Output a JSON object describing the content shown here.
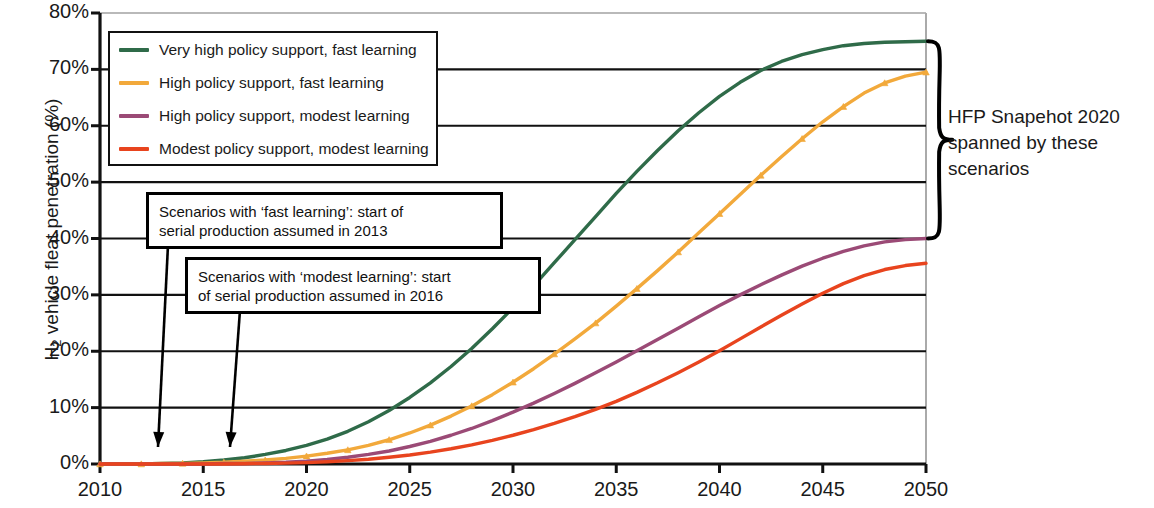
{
  "chart_data": {
    "type": "line",
    "title": "",
    "xlabel": "",
    "ylabel": "H₂ vehicle fleat penetration (%)",
    "xlim": [
      2010,
      2050
    ],
    "ylim": [
      0,
      80
    ],
    "grid": "horizontal",
    "legend_position": "top-left inside",
    "y_tick_labels": [
      "0%",
      "10%",
      "20%",
      "30%",
      "40%",
      "50%",
      "60%",
      "70%",
      "80%"
    ],
    "y_tick_values": [
      0,
      10,
      20,
      30,
      40,
      50,
      60,
      70,
      80
    ],
    "x_tick_labels": [
      "2010",
      "2015",
      "2020",
      "2025",
      "2030",
      "2035",
      "2040",
      "2045",
      "2050"
    ],
    "x_tick_values": [
      2010,
      2015,
      2020,
      2025,
      2030,
      2035,
      2040,
      2045,
      2050
    ],
    "x": [
      2010,
      2011,
      2012,
      2013,
      2014,
      2015,
      2016,
      2017,
      2018,
      2019,
      2020,
      2021,
      2022,
      2023,
      2024,
      2025,
      2026,
      2027,
      2028,
      2029,
      2030,
      2031,
      2032,
      2033,
      2034,
      2035,
      2036,
      2037,
      2038,
      2039,
      2040,
      2041,
      2042,
      2043,
      2044,
      2045,
      2046,
      2047,
      2048,
      2049,
      2050
    ],
    "series": [
      {
        "name": "Very high policy support, fast learning",
        "color": "#2f6b49",
        "marker": "none",
        "values": [
          0.0,
          0.0,
          0.0,
          0.1,
          0.2,
          0.4,
          0.7,
          1.1,
          1.7,
          2.4,
          3.3,
          4.4,
          5.8,
          7.5,
          9.5,
          11.8,
          14.4,
          17.3,
          20.5,
          24.0,
          27.7,
          31.6,
          35.7,
          39.8,
          43.9,
          48.0,
          51.9,
          55.6,
          59.1,
          62.3,
          65.2,
          67.7,
          69.8,
          71.4,
          72.6,
          73.5,
          74.2,
          74.6,
          74.8,
          74.9,
          75.0
        ]
      },
      {
        "name": "High policy support, fast learning",
        "color": "#f2a93b",
        "marker": "triangle",
        "values": [
          0.0,
          0.0,
          0.0,
          0.1,
          0.1,
          0.2,
          0.3,
          0.5,
          0.7,
          1.0,
          1.4,
          1.9,
          2.5,
          3.3,
          4.3,
          5.5,
          6.9,
          8.5,
          10.3,
          12.3,
          14.5,
          16.9,
          19.5,
          22.2,
          25.0,
          28.0,
          31.1,
          34.3,
          37.6,
          41.0,
          44.4,
          47.8,
          51.2,
          54.5,
          57.7,
          60.7,
          63.4,
          65.8,
          67.6,
          68.8,
          69.5
        ]
      },
      {
        "name": "High policy support, modest learning",
        "color": "#9b4a76",
        "marker": "none",
        "values": [
          0.0,
          0.0,
          0.0,
          0.0,
          0.0,
          0.0,
          0.1,
          0.1,
          0.2,
          0.3,
          0.5,
          0.8,
          1.2,
          1.7,
          2.3,
          3.1,
          4.0,
          5.1,
          6.3,
          7.7,
          9.2,
          10.8,
          12.5,
          14.3,
          16.2,
          18.1,
          20.1,
          22.1,
          24.1,
          26.1,
          28.1,
          30.0,
          31.8,
          33.5,
          35.1,
          36.5,
          37.7,
          38.7,
          39.4,
          39.8,
          40.0
        ]
      },
      {
        "name": "Modest policy support, modest learning",
        "color": "#e8441e",
        "marker": "none",
        "values": [
          0.0,
          0.0,
          0.0,
          0.0,
          0.0,
          0.0,
          0.0,
          0.05,
          0.1,
          0.15,
          0.25,
          0.4,
          0.6,
          0.85,
          1.2,
          1.6,
          2.1,
          2.7,
          3.4,
          4.2,
          5.1,
          6.1,
          7.2,
          8.4,
          9.7,
          11.1,
          12.7,
          14.4,
          16.2,
          18.1,
          20.1,
          22.2,
          24.3,
          26.4,
          28.4,
          30.3,
          32.0,
          33.4,
          34.5,
          35.2,
          35.6
        ]
      }
    ]
  },
  "legend": {
    "items": [
      {
        "label": "Very high policy support, fast learning",
        "color": "#2f6b49"
      },
      {
        "label": "High policy support, fast learning",
        "color": "#f2a93b"
      },
      {
        "label": "High policy support, modest learning",
        "color": "#9b4a76"
      },
      {
        "label": "Modest policy support, modest learning",
        "color": "#e8441e"
      }
    ]
  },
  "annotations": {
    "fast_learning": {
      "line1": "Scenarios with ‘fast learning’: start of",
      "line2": "serial production assumed in 2013"
    },
    "modest_learning": {
      "line1": "Scenarios with ‘modest learning’: start",
      "line2": "of serial production assumed in 2016"
    },
    "brace_note": {
      "line1": "HFP Snapehot 2020",
      "line2": "spanned by these",
      "line3": "scenarios"
    }
  },
  "axes": {
    "y_label_prefix": "H",
    "y_label_sub": "2",
    "y_label_rest": " vehicle fleat penetration (%)"
  }
}
